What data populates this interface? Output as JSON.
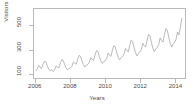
{
  "chart_data": {
    "type": "line",
    "title": "",
    "xlabel": "Years",
    "ylabel": "Visitors",
    "grid": false,
    "legend": false,
    "xlim": [
      2005.9,
      2014.6
    ],
    "ylim": [
      60,
      640
    ],
    "x_ticks": [
      2006,
      2008,
      2010,
      2012,
      2014
    ],
    "x_tick_labels": [
      "2006",
      "2008",
      "2010",
      "2012",
      "2014"
    ],
    "y_ticks": [
      100,
      300,
      500
    ],
    "y_tick_labels": [
      "100",
      "300",
      "500"
    ],
    "line_color": "#9a9a9a",
    "series": [
      {
        "name": "Visitors",
        "x": [
          2006.0,
          2006.083,
          2006.167,
          2006.25,
          2006.333,
          2006.417,
          2006.5,
          2006.583,
          2006.667,
          2006.75,
          2006.833,
          2006.917,
          2007.0,
          2007.083,
          2007.167,
          2007.25,
          2007.333,
          2007.417,
          2007.5,
          2007.583,
          2007.667,
          2007.75,
          2007.833,
          2007.917,
          2008.0,
          2008.083,
          2008.167,
          2008.25,
          2008.333,
          2008.417,
          2008.5,
          2008.583,
          2008.667,
          2008.75,
          2008.833,
          2008.917,
          2009.0,
          2009.083,
          2009.167,
          2009.25,
          2009.333,
          2009.417,
          2009.5,
          2009.583,
          2009.667,
          2009.75,
          2009.833,
          2009.917,
          2010.0,
          2010.083,
          2010.167,
          2010.25,
          2010.333,
          2010.417,
          2010.5,
          2010.583,
          2010.667,
          2010.75,
          2010.833,
          2010.917,
          2011.0,
          2011.083,
          2011.167,
          2011.25,
          2011.333,
          2011.417,
          2011.5,
          2011.583,
          2011.667,
          2011.75,
          2011.833,
          2011.917,
          2012.0,
          2012.083,
          2012.167,
          2012.25,
          2012.333,
          2012.417,
          2012.5,
          2012.583,
          2012.667,
          2012.75,
          2012.833,
          2012.917,
          2013.0,
          2013.083,
          2013.167,
          2013.25,
          2013.333,
          2013.417,
          2013.5,
          2013.583,
          2013.667,
          2013.75,
          2013.833,
          2013.917,
          2014.0,
          2014.083,
          2014.167,
          2014.25,
          2014.333,
          2014.417
        ],
        "values": [
          120,
          135,
          165,
          150,
          140,
          175,
          200,
          195,
          160,
          135,
          120,
          130,
          115,
          128,
          162,
          152,
          145,
          185,
          215,
          208,
          172,
          146,
          128,
          140,
          145,
          158,
          196,
          184,
          176,
          218,
          250,
          242,
          202,
          172,
          152,
          168,
          175,
          190,
          232,
          218,
          208,
          254,
          290,
          282,
          238,
          204,
          182,
          198,
          205,
          222,
          268,
          252,
          242,
          292,
          332,
          322,
          274,
          236,
          212,
          230,
          240,
          258,
          308,
          290,
          280,
          334,
          378,
          366,
          314,
          272,
          246,
          266,
          278,
          298,
          352,
          332,
          320,
          378,
          426,
          412,
          356,
          310,
          282,
          304,
          318,
          340,
          398,
          376,
          362,
          424,
          476,
          460,
          400,
          350,
          320,
          344,
          360,
          384,
          446,
          422,
          486,
          560
        ]
      }
    ]
  }
}
